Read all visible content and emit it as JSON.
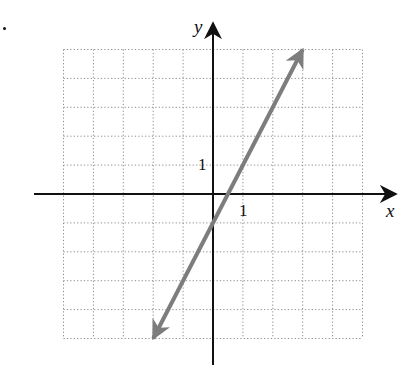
{
  "figure": {
    "xlabel": "x",
    "ylabel": "y",
    "x_tick_label": "1",
    "y_tick_label": "1",
    "colors": {
      "grid": "#8a8a8a",
      "axes": "#111111",
      "line": "#7d7d7d"
    }
  },
  "chart_data": {
    "type": "line",
    "title": "",
    "xlabel": "x",
    "ylabel": "y",
    "xlim": [
      -5,
      5
    ],
    "ylim": [
      -5,
      5
    ],
    "grid": true,
    "grid_style": "dotted",
    "grid_step": 1,
    "tick_labels": {
      "x": [
        "1"
      ],
      "y": [
        "1"
      ]
    },
    "legend": null,
    "series": [
      {
        "name": "y = 2x - 1",
        "equation": "y = 2x - 1",
        "slope": 2,
        "intercept": -1,
        "arrows_both_ends": true,
        "x": [
          -2,
          -1,
          0,
          0.5,
          1,
          2,
          3
        ],
        "y": [
          -5,
          -3,
          -1,
          0,
          1,
          3,
          5
        ]
      }
    ]
  }
}
